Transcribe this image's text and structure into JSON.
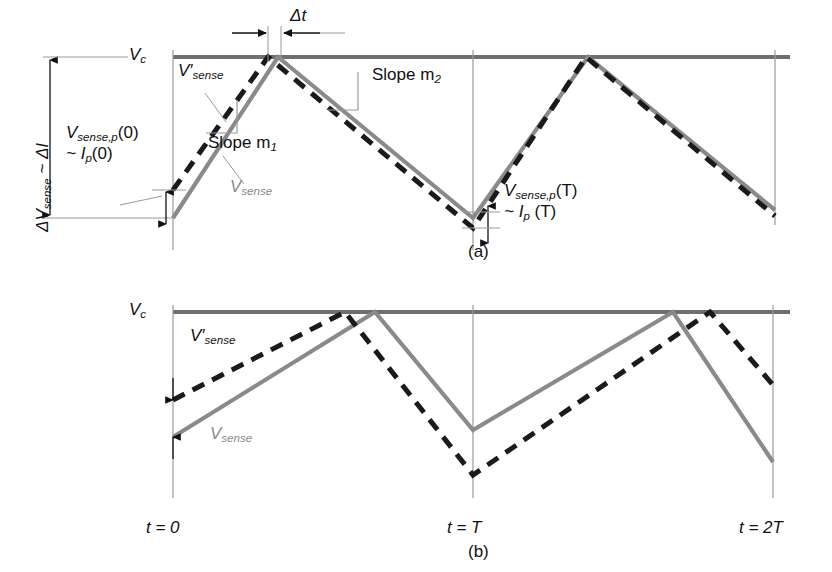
{
  "figure": {
    "domain": "technical-waveform-diagram",
    "colors": {
      "vsense_gray": "#8a8a8a",
      "vprime_dashed_black": "#1a1a1a",
      "threshold_line": "#6e6e6e",
      "axis_thin": "#9a9a9a",
      "text": "#111111",
      "background": "#ffffff"
    }
  },
  "panel_a": {
    "tag": "(a)",
    "threshold_label": "V",
    "threshold_sub": "c",
    "axis_bracket_label_line1_pre": "ΔV",
    "axis_bracket_label_line1_sub": "sense",
    "axis_bracket_label_line1_post": " ~ ΔI",
    "dim_label_line1_pre": "V",
    "dim_label_line1_sub": "sense,p",
    "dim_label_line1_post": "(0)",
    "dim_label_line2_pre": "~ I",
    "dim_label_line2_sub": "p",
    "dim_label_line2_post": "(0)",
    "dim_right_line1_pre": "V",
    "dim_right_line1_sub": "sense,p",
    "dim_right_line1_post": "(T)",
    "dim_right_line2_pre": "~ I",
    "dim_right_line2_sub": "p",
    "dim_right_line2_post": " (T)",
    "delta_t_label": "Δt",
    "vprime_label_pre": "V′",
    "vprime_label_sub": "sense",
    "vsense_label_pre": "V",
    "vsense_label_sub": "sense",
    "slope1_label_pre": "Slope m",
    "slope1_label_sub": "1",
    "slope2_label_pre": "Slope m",
    "slope2_label_sub": "2"
  },
  "panel_b": {
    "tag": "(b)",
    "threshold_label": "V",
    "threshold_sub": "c",
    "vprime_label_pre": "V′",
    "vprime_label_sub": "sense",
    "vsense_label_pre": "V",
    "vsense_label_sub": "sense",
    "t0_label": "t = 0",
    "tT_label": "t = T",
    "t2T_label": "t = 2T"
  },
  "chart_data": {
    "type": "line",
    "title": "",
    "xlabel": "",
    "ylabel": "",
    "axis_note": "x axis is time in units of switching period T; y axis is sense voltage (arbitrary units, higher is toward Vc threshold at top)",
    "xticks": [
      "t = 0",
      "t = T",
      "t = 2T"
    ],
    "xtick_px": [
      173,
      473,
      773
    ],
    "yref": {
      "Vc_threshold_px": 57,
      "panel_b_Vc_threshold_px": 312
    },
    "panels": [
      {
        "name": "(a)",
        "note": "Stable operation: perturbed waveform V'sense converges back toward Vsense; peak time offset delta-t shrinks each cycle.",
        "series": [
          {
            "name": "Vsense",
            "style": "solid",
            "color": "#8a8a8a",
            "points_px": [
              [
                173,
                218
              ],
              [
                278,
                57
              ],
              [
                473,
                218
              ],
              [
                588,
                57
              ],
              [
                775,
                210
              ]
            ]
          },
          {
            "name": "V'sense",
            "style": "dashed",
            "color": "#1a1a1a",
            "points_px": [
              [
                173,
                190
              ],
              [
                268,
                57
              ],
              [
                473,
                228
              ],
              [
                586,
                57
              ],
              [
                775,
                216
              ]
            ]
          }
        ],
        "annotations": [
          {
            "label": "Vc",
            "type": "threshold-line",
            "y_px": 57
          },
          {
            "label": "Δt",
            "type": "dimension-horizontal",
            "x1_px": 268,
            "x2_px": 281,
            "y_px": 33
          },
          {
            "label": "ΔVsense ~ ΔI",
            "type": "dimension-vertical",
            "x_px": 50,
            "y1_px": 57,
            "y2_px": 218
          },
          {
            "label": "Vsense,p(0) ~ Ip(0)",
            "type": "dimension-vertical",
            "x_px": 166,
            "y1_px": 190,
            "y2_px": 224
          },
          {
            "label": "Vsense,p(T) ~ Ip(T)",
            "type": "dimension-vertical",
            "x_px": 488,
            "y1_px": 211,
            "y2_px": 238
          },
          {
            "label": "Slope m1",
            "type": "leader-bracket",
            "target_px": [
              230,
              120
            ]
          },
          {
            "label": "Slope m2",
            "type": "leader-bracket",
            "target_px": [
              345,
              105
            ]
          }
        ]
      },
      {
        "name": "(b)",
        "note": "Unstable operation: perturbation grows; peak time offset between V'sense and Vsense increases each cycle.",
        "series": [
          {
            "name": "Vsense",
            "style": "solid",
            "color": "#8a8a8a",
            "points_px": [
              [
                173,
                437
              ],
              [
                375,
                312
              ],
              [
                473,
                430
              ],
              [
                673,
                312
              ],
              [
                773,
                462
              ]
            ]
          },
          {
            "name": "V'sense",
            "style": "dashed",
            "color": "#1a1a1a",
            "points_px": [
              [
                173,
                400
              ],
              [
                345,
                312
              ],
              [
                473,
                475
              ],
              [
                710,
                312
              ],
              [
                773,
                385
              ]
            ]
          }
        ],
        "annotations": [
          {
            "label": "Vc",
            "type": "threshold-line",
            "y_px": 312
          },
          {
            "label": "t = 0",
            "type": "x-axis-tick",
            "x_px": 173
          },
          {
            "label": "t = T",
            "type": "x-axis-tick",
            "x_px": 473
          },
          {
            "label": "t = 2T",
            "type": "x-axis-tick",
            "x_px": 773
          }
        ]
      }
    ]
  }
}
